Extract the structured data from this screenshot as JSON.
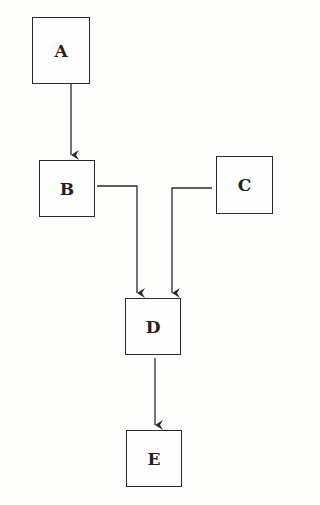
{
  "diagram": {
    "type": "flowchart",
    "nodes": [
      {
        "id": "A",
        "label": "A"
      },
      {
        "id": "B",
        "label": "B"
      },
      {
        "id": "C",
        "label": "C"
      },
      {
        "id": "D",
        "label": "D"
      },
      {
        "id": "E",
        "label": "E"
      }
    ],
    "edges": [
      {
        "from": "A",
        "to": "B"
      },
      {
        "from": "B",
        "to": "D"
      },
      {
        "from": "C",
        "to": "D"
      },
      {
        "from": "D",
        "to": "E"
      }
    ],
    "colors": {
      "stroke": "#2a2a2a",
      "background": "#fdfdfb"
    }
  }
}
